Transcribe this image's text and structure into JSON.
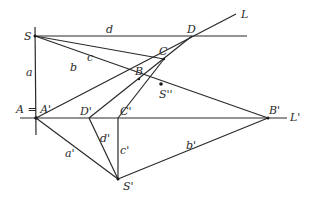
{
  "diagram": {
    "type": "perspective-geometry-construction",
    "points": {
      "S": {
        "label": "S",
        "x": 35,
        "y": 36
      },
      "A": {
        "label": "A = A'",
        "x": 36,
        "y": 118
      },
      "B": {
        "label": "B",
        "x": 139,
        "y": 79
      },
      "C": {
        "label": "C",
        "x": 164,
        "y": 59
      },
      "D": {
        "label": "D",
        "x": 192,
        "y": 36
      },
      "S2": {
        "label": "S''",
        "x": 161,
        "y": 84
      },
      "Dp": {
        "label": "D'",
        "x": 89,
        "y": 118
      },
      "Cp": {
        "label": "C'",
        "x": 118,
        "y": 118
      },
      "Bp": {
        "label": "B'",
        "x": 268,
        "y": 118
      },
      "Sp": {
        "label": "S'",
        "x": 118,
        "y": 179
      }
    },
    "lines": {
      "L": {
        "label": "L"
      },
      "Lp": {
        "label": "L'"
      }
    },
    "segment_labels": {
      "a": "a",
      "b": "b",
      "c": "c",
      "d": "d",
      "a_prime": "a'",
      "b_prime": "b'",
      "c_prime": "c'",
      "d_prime": "d'"
    }
  }
}
